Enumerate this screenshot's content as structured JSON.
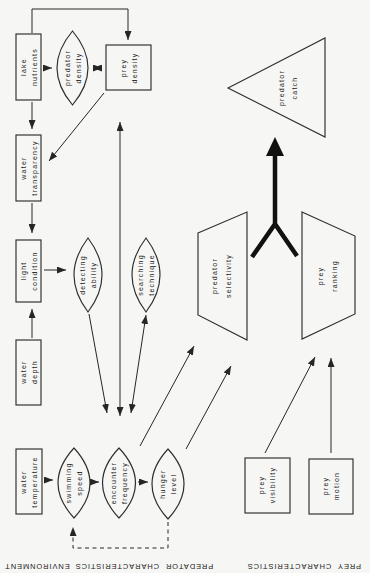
{
  "colors": {
    "background": "#f6f6f4",
    "ink": "#262626"
  },
  "nodes": {
    "lake_nutrients": "lake\nnutrients",
    "predator_density": "predator\ndensity",
    "prey_density": "prey\ndensity",
    "water_transparency": "water\ntransparency",
    "light_condition": "light\ncondition",
    "detecting_ability": "detecting\nability",
    "searching_technique": "searching\ntechnique",
    "water_depth": "water\ndepth",
    "water_temperature": "water\ntemperature",
    "swimming_speed": "swimming\nspeed",
    "encounter_frequency": "encounter\nfrequency",
    "hunger_level": "hunger\nlevel",
    "predator_selectivity": "predator\nselectivity",
    "prey_ranking": "prey\nranking",
    "predator_catch": "predator\ncatch",
    "prey_visibility": "prey\nvisibility",
    "prey_motion": "prey\nmotion"
  },
  "sections": {
    "environment": "ENVIRONMENT",
    "predator_characteristics": "PREDATOR  CHARACTERISTICS",
    "prey_characteristics": "PREY  CHARACTERISTICS"
  }
}
